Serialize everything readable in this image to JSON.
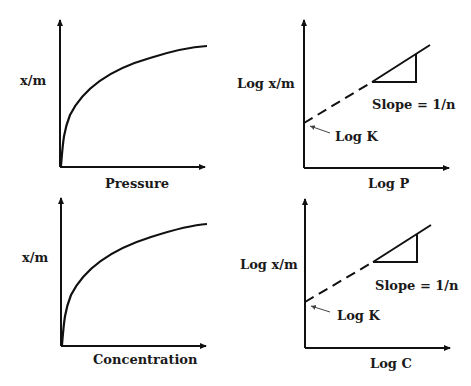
{
  "panels": [
    {
      "id": "freundlich-pressure",
      "ylabel": "x/m",
      "xlabel": "Pressure",
      "type": "curve"
    },
    {
      "id": "log-pressure",
      "ylabel": "Log x/m",
      "xlabel": "Log P",
      "type": "log-linear",
      "slope_label": "Slope = 1/n",
      "intercept_label": "Log K"
    },
    {
      "id": "freundlich-concentration",
      "ylabel": "x/m",
      "xlabel": "Concentration",
      "type": "curve"
    },
    {
      "id": "log-concentration",
      "ylabel": "Log x/m",
      "xlabel": "Log C",
      "type": "log-linear",
      "slope_label": "Slope = 1/n",
      "intercept_label": "Log K"
    }
  ],
  "colors": {
    "line": "#111111",
    "text": "#1a1a1a",
    "background": "#ffffff"
  }
}
